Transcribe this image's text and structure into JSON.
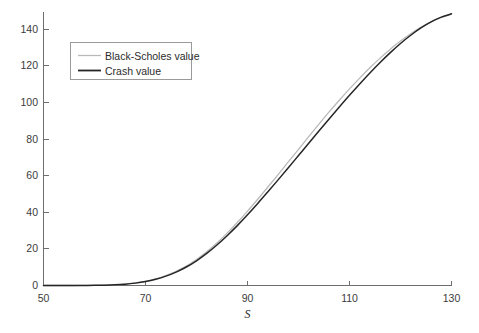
{
  "figure": {
    "background_color": "#ffffff",
    "axis_color": "#6e6e6e",
    "width": 479,
    "height": 333
  },
  "chart_data": {
    "type": "line",
    "title": "",
    "subtitle": "",
    "xlabel": "S",
    "ylabel": "",
    "xlim": [
      50,
      130
    ],
    "ylim": [
      0,
      148
    ],
    "grid": false,
    "legend_position": "upper-left",
    "xticks": [
      50,
      70,
      90,
      110,
      130
    ],
    "xtick_labels": [
      "50",
      "70",
      "90",
      "110",
      "130"
    ],
    "yticks": [
      0,
      20,
      40,
      60,
      80,
      100,
      120,
      140
    ],
    "ytick_labels": [
      "0",
      "20",
      "40",
      "60",
      "80",
      "100",
      "120",
      "140"
    ],
    "x": [
      50,
      52,
      54,
      56,
      58,
      60,
      62,
      64,
      66,
      68,
      70,
      72,
      74,
      76,
      78,
      80,
      82,
      84,
      86,
      88,
      90,
      92,
      94,
      96,
      98,
      100,
      102,
      104,
      106,
      108,
      110,
      112,
      114,
      116,
      118,
      120,
      122,
      124,
      126,
      128,
      130
    ],
    "series": [
      {
        "name": "Black-Scholes value",
        "color": "#b9b9b9",
        "line_width": 1.3,
        "values": [
          0.0,
          0.0,
          0.0,
          0.0,
          0.05,
          0.1,
          0.2,
          0.4,
          0.8,
          1.4,
          2.3,
          3.6,
          5.4,
          7.7,
          10.6,
          14.2,
          18.4,
          23.2,
          28.6,
          34.4,
          40.6,
          47.1,
          53.8,
          60.6,
          67.5,
          74.4,
          81.3,
          88.1,
          94.8,
          101.2,
          107.4,
          113.3,
          118.9,
          124.2,
          129.1,
          133.5,
          137.5,
          141.0,
          144.0,
          146.4,
          148.2
        ]
      },
      {
        "name": "Crash value",
        "color": "#262626",
        "line_width": 1.5,
        "values": [
          0.0,
          0.0,
          0.0,
          0.0,
          0.04,
          0.09,
          0.18,
          0.36,
          0.72,
          1.3,
          2.15,
          3.4,
          5.1,
          7.3,
          10.1,
          13.5,
          17.5,
          22.1,
          27.2,
          32.7,
          38.6,
          44.8,
          51.2,
          57.7,
          64.3,
          71.0,
          77.7,
          84.4,
          91.0,
          97.5,
          103.9,
          110.1,
          116.1,
          121.8,
          127.2,
          132.2,
          136.7,
          140.7,
          144.0,
          146.6,
          148.4
        ]
      }
    ],
    "annotations": []
  },
  "legend": {
    "entries": [
      {
        "label": "Black-Scholes value",
        "color": "#b9b9b9"
      },
      {
        "label": "Crash value",
        "color": "#262626"
      }
    ]
  }
}
